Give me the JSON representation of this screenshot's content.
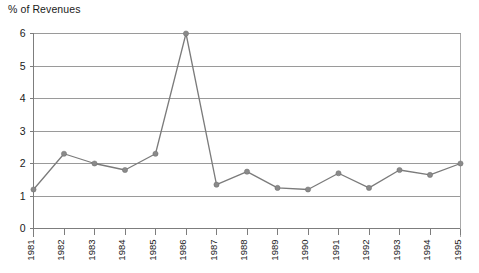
{
  "chart_data": {
    "type": "line",
    "title": "",
    "ylabel": "% of Revenues",
    "xlabel": "",
    "ylim": [
      0,
      6
    ],
    "yticks": [
      0,
      1,
      2,
      3,
      4,
      5,
      6
    ],
    "ytick_labels": [
      "0",
      "1",
      "2",
      "3",
      "4",
      "5",
      "6"
    ],
    "grid": true,
    "legend": "none",
    "categories": [
      "1981",
      "1982",
      "1983",
      "1984",
      "1985",
      "1986",
      "1987",
      "1988",
      "1989",
      "1990",
      "1991",
      "1992",
      "1993",
      "1994",
      "1995"
    ],
    "values": [
      1.2,
      2.3,
      2.0,
      1.8,
      2.3,
      6.0,
      1.35,
      1.75,
      1.25,
      1.2,
      1.7,
      1.25,
      1.8,
      1.65,
      2.0
    ],
    "series": [
      {
        "name": "% of Revenues",
        "values": [
          1.2,
          2.3,
          2.0,
          1.8,
          2.3,
          6.0,
          1.35,
          1.75,
          1.25,
          1.2,
          1.7,
          1.25,
          1.8,
          1.65,
          2.0
        ],
        "marker": "circle",
        "color": "#8a8a8a"
      }
    ],
    "xtick_rotation": -90,
    "annotations": []
  },
  "colors": {
    "line": "#7b7b7b",
    "marker": "#8a8a8a",
    "grid": "#9a9a9a",
    "axis": "#7d7d7d",
    "text": "#1a1a1a",
    "background": "#ffffff"
  }
}
